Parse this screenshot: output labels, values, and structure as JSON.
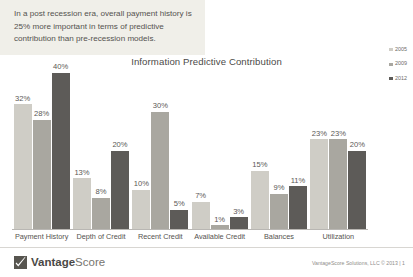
{
  "caption": {
    "text": "In a post recession era, overall payment history is 25% more important in terms of predictive contribution than pre-recession models."
  },
  "chart_data": {
    "type": "bar",
    "title": "Information Predictive Contribution",
    "xlabel": "",
    "ylabel": "",
    "ylim": [
      0,
      40
    ],
    "grid": false,
    "legend_position": "right",
    "categories": [
      "Payment History",
      "Depth of Credit",
      "Recent Credit",
      "Available Credit",
      "Balances",
      "Utilization"
    ],
    "series": [
      {
        "name": "2005",
        "color": "#cfcdc6",
        "values": [
          32,
          13,
          10,
          7,
          15,
          23
        ],
        "labels": [
          "32%",
          "13%",
          "10%",
          "7%",
          "15%",
          "23%"
        ]
      },
      {
        "name": "2009",
        "color": "#a9a7a0",
        "values": [
          28,
          8,
          30,
          1,
          9,
          23
        ],
        "labels": [
          "28%",
          "8%",
          "30%",
          "1%",
          "9%",
          "23%"
        ]
      },
      {
        "name": "2012",
        "color": "#5d5b58",
        "values": [
          40,
          20,
          5,
          3,
          11,
          20
        ],
        "labels": [
          "40%",
          "20%",
          "5%",
          "3%",
          "11%",
          "20%"
        ]
      }
    ]
  },
  "footer": {
    "logo_name_bold": "Vantage",
    "logo_name_light": "Score",
    "copyright": "VantageScore Solutions, LLC © 2013 | 1"
  }
}
